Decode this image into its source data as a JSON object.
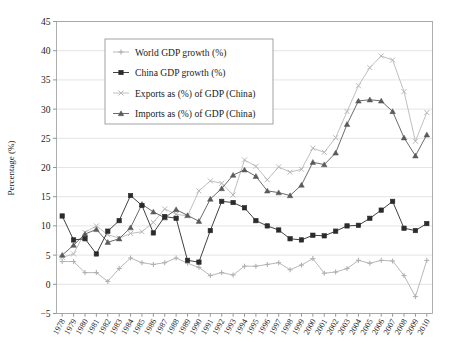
{
  "chart_data": {
    "type": "line",
    "title": "",
    "xlabel": "",
    "ylabel": "Percentage (%)",
    "ylim": [
      -5,
      45
    ],
    "yticks": [
      -5,
      0,
      5,
      10,
      15,
      20,
      25,
      30,
      35,
      40,
      45
    ],
    "grid": true,
    "legend_position": "upper-left",
    "categories": [
      "1978",
      "1979",
      "1980",
      "1981",
      "1982",
      "1983",
      "1984",
      "1985",
      "1986",
      "1987",
      "1988",
      "1989",
      "1990",
      "1991",
      "1992",
      "1993",
      "1994",
      "1995",
      "1996",
      "1997",
      "1998",
      "1999",
      "2000",
      "2001",
      "2002",
      "2003",
      "2004",
      "2005",
      "2006",
      "2007",
      "2008",
      "2009",
      "2010"
    ],
    "series": [
      {
        "name": "World GDP growth (%)",
        "color": "#b0b0b0",
        "marker": "plus",
        "values": [
          3.9,
          3.9,
          2.0,
          2.0,
          0.5,
          2.7,
          4.5,
          3.7,
          3.4,
          3.7,
          4.5,
          3.6,
          2.9,
          1.5,
          2.0,
          1.6,
          3.1,
          3.1,
          3.4,
          3.7,
          2.5,
          3.3,
          4.4,
          1.9,
          2.1,
          2.7,
          4.1,
          3.6,
          4.1,
          4.0,
          1.5,
          -2.1,
          4.1
        ]
      },
      {
        "name": "China GDP growth (%)",
        "color": "#2b2b2b",
        "marker": "square",
        "values": [
          11.7,
          7.6,
          7.8,
          5.2,
          9.1,
          10.9,
          15.2,
          13.5,
          8.8,
          11.6,
          11.3,
          4.1,
          3.8,
          9.2,
          14.2,
          14.0,
          13.1,
          10.9,
          10.0,
          9.3,
          7.8,
          7.6,
          8.4,
          8.3,
          9.1,
          10.0,
          10.1,
          11.3,
          12.7,
          14.2,
          9.6,
          9.2,
          10.4
        ]
      },
      {
        "name": "Exports as (%) of GDP (China)",
        "color": "#b8b8b8",
        "marker": "cross",
        "values": [
          4.6,
          5.2,
          8.9,
          10.0,
          8.5,
          7.9,
          8.7,
          9.0,
          10.6,
          12.9,
          12.0,
          11.7,
          16.0,
          17.7,
          17.3,
          15.3,
          21.3,
          20.2,
          17.9,
          20.1,
          19.2,
          19.7,
          23.3,
          22.6,
          25.1,
          29.6,
          34.0,
          37.1,
          39.1,
          38.4,
          33.0,
          24.5,
          29.4
        ]
      },
      {
        "name": "Imports as (%) of GDP (China)",
        "color": "#5a5a5a",
        "marker": "triangle",
        "values": [
          5.0,
          6.7,
          8.6,
          9.4,
          7.2,
          7.8,
          9.7,
          13.7,
          12.4,
          11.4,
          12.8,
          11.8,
          10.8,
          14.6,
          16.4,
          18.7,
          19.6,
          18.5,
          16.0,
          15.7,
          15.2,
          17.0,
          20.9,
          20.5,
          22.5,
          27.4,
          31.4,
          31.6,
          31.4,
          29.6,
          25.1,
          22.0,
          25.6
        ]
      }
    ]
  },
  "axes": {
    "y_axis_title": "Percentage (%)"
  },
  "legend": {
    "items": [
      {
        "label": "World GDP growth (%)"
      },
      {
        "label": "China GDP growth (%)"
      },
      {
        "label": "Exports as (%) of GDP (China)"
      },
      {
        "label": "Imports as (%) of GDP (China)"
      }
    ]
  }
}
